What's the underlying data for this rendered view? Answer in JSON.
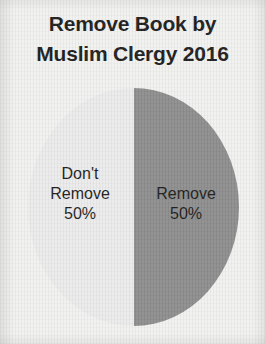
{
  "chart_data": {
    "type": "pie",
    "title": "Remove Book by Muslim Clergy 2016",
    "title_lines": [
      "Remove Book by",
      "Muslim Clergy 2016"
    ],
    "categories": [
      "Don't Remove",
      "Remove"
    ],
    "values": [
      50,
      50
    ],
    "value_labels": [
      "50%",
      "50%"
    ],
    "colors": [
      "#ebebeb",
      "#8d8d8d"
    ],
    "legend": "none",
    "labels_inside": true,
    "slices": [
      {
        "name": "Don't Remove",
        "value": 50,
        "value_label": "50%",
        "color": "#ebebeb",
        "label_lines": [
          "Don't",
          "Remove",
          "50%"
        ]
      },
      {
        "name": "Remove",
        "value": 50,
        "value_label": "50%",
        "color": "#8d8d8d",
        "label_lines": [
          "Remove",
          "50%"
        ]
      }
    ]
  },
  "page": {
    "background_color": "#f1f1ef",
    "text_color": "#1d1d1d"
  }
}
